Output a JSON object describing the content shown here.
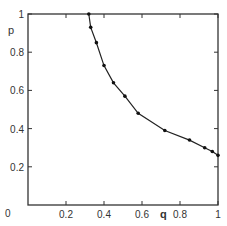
{
  "chart_data": {
    "type": "line",
    "title": "",
    "xlabel": "q",
    "ylabel": "p",
    "xlim": [
      0,
      1
    ],
    "ylim": [
      0,
      1
    ],
    "grid": false,
    "legend": null,
    "x_ticks": [
      "0",
      "0.2",
      "0.4",
      "0.6",
      "0.8",
      "1"
    ],
    "y_ticks": [
      "0.2",
      "0.4",
      "0.6",
      "0.8",
      "1"
    ],
    "x_tick_labels_rendered": [
      "0",
      "0.2",
      "0.4",
      "06",
      "08",
      "1"
    ],
    "series": [
      {
        "name": "p(q)",
        "markers": true,
        "x": [
          0.32,
          0.33,
          0.36,
          0.4,
          0.45,
          0.51,
          0.58,
          0.72,
          0.85,
          0.93,
          0.97,
          1.0
        ],
        "y": [
          1.0,
          0.93,
          0.85,
          0.73,
          0.64,
          0.57,
          0.48,
          0.39,
          0.34,
          0.3,
          0.28,
          0.26
        ]
      }
    ]
  },
  "labels": {
    "origin": "0",
    "x_axis": "q",
    "y_axis": "p",
    "x_ticks": [
      "0.2",
      "0.4",
      "0.6",
      "0.8",
      "1"
    ],
    "y_ticks": [
      "1",
      "0.8",
      "0.6",
      "0.4",
      "0.2"
    ]
  }
}
